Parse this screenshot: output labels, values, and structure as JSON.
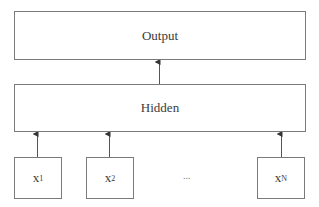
{
  "diagram": {
    "type": "neural-network-layers",
    "layers": {
      "output": {
        "label": "Output"
      },
      "hidden": {
        "label": "Hidden"
      }
    },
    "inputs": [
      {
        "var": "x",
        "sub": "1"
      },
      {
        "var": "x",
        "sub": "2"
      },
      {
        "var": "x",
        "sub": "N"
      }
    ],
    "ellipsis": "...",
    "edges": [
      {
        "from": "x1",
        "to": "hidden"
      },
      {
        "from": "x2",
        "to": "hidden"
      },
      {
        "from": "xN",
        "to": "hidden"
      },
      {
        "from": "hidden",
        "to": "output"
      }
    ],
    "colors": {
      "line": "#555555",
      "box_border": "#7a7a7a",
      "text": "#3a3a3a"
    }
  }
}
